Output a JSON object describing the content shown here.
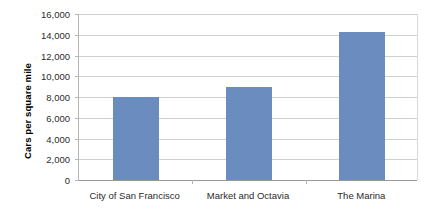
{
  "chart_data": {
    "type": "bar",
    "title": "",
    "subtitle": "",
    "xlabel": "",
    "ylabel": "Cars per square mile",
    "categories": [
      "City of San Francisco",
      "Market and Octavia",
      "The Marina"
    ],
    "values": [
      8000,
      8950,
      14300
    ],
    "series": [
      {
        "name": "Cars per square mile",
        "values": [
          8000,
          8950,
          14300
        ],
        "color": "#6a8cbe"
      }
    ],
    "ylim": [
      0,
      16000
    ],
    "ytick_step": 2000,
    "ytick_labels": [
      "0",
      "2,000",
      "4,000",
      "6,000",
      "8,000",
      "10,000",
      "12,000",
      "14,000",
      "16,000"
    ],
    "ytick_values": [
      0,
      2000,
      4000,
      6000,
      8000,
      10000,
      12000,
      14000,
      16000
    ],
    "grid": true,
    "grid_axis": "y",
    "legend": false,
    "legend_position": "none",
    "background_color": "#ffffff",
    "gridline_color": "#d0d0d0",
    "axis_color": "#b5b5b5"
  }
}
